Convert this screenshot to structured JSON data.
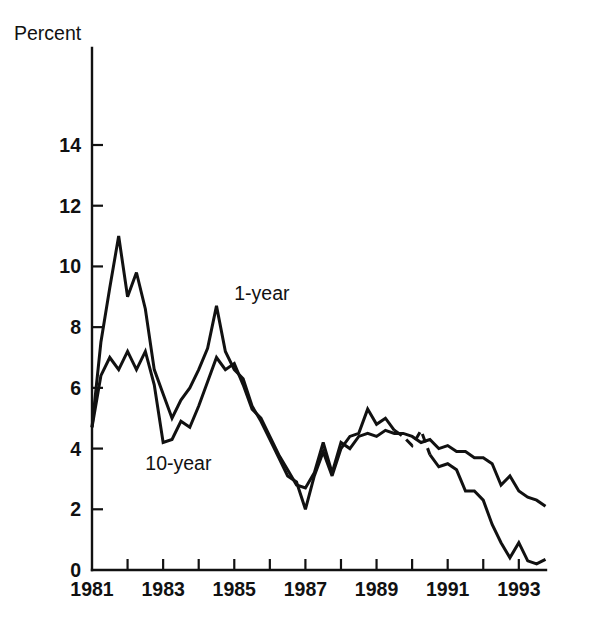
{
  "chart_data": {
    "type": "line",
    "title": "",
    "subtitle": "",
    "xlabel": "",
    "ylabel": "Percent",
    "ylabel_position": "top-left",
    "xlim": [
      1981,
      1993.75
    ],
    "ylim": [
      0,
      15
    ],
    "grid": false,
    "legend": "inline-annotations",
    "y_ticks": [
      0,
      2,
      4,
      6,
      8,
      10,
      12,
      14
    ],
    "y_tick_labels": [
      "0",
      "2",
      "4",
      "6",
      "8",
      "10",
      "12",
      "14"
    ],
    "x_ticks": [
      1981,
      1982,
      1983,
      1984,
      1985,
      1986,
      1987,
      1988,
      1989,
      1990,
      1991,
      1992,
      1993
    ],
    "x_tick_labels": [
      "1981",
      "",
      "1983",
      "",
      "1985",
      "",
      "1987",
      "",
      "1989",
      "",
      "1991",
      "",
      "1993"
    ],
    "x_tick_labels_shown": [
      "1981",
      "1983",
      "1985",
      "1987",
      "1989",
      "1991",
      "1993"
    ],
    "annotations": [
      {
        "text": "1-year",
        "x": 1985.0,
        "y": 8.9,
        "series": "1-year"
      },
      {
        "text": "10-year",
        "x": 1982.5,
        "y": 3.3,
        "series": "10-year"
      }
    ],
    "line_color": "#111111",
    "series": [
      {
        "name": "1-year",
        "style": "solid-with-dashed-gap",
        "dashed_x_range": [
          1989.6,
          1990.4
        ],
        "x": [
          1981.0,
          1981.25,
          1981.5,
          1981.75,
          1982.0,
          1982.25,
          1982.5,
          1982.75,
          1983.0,
          1983.25,
          1983.5,
          1983.75,
          1984.0,
          1984.25,
          1984.5,
          1984.75,
          1985.0,
          1985.25,
          1985.5,
          1985.75,
          1986.0,
          1986.25,
          1986.5,
          1986.75,
          1987.0,
          1987.25,
          1987.5,
          1987.75,
          1988.0,
          1988.25,
          1988.5,
          1988.75,
          1989.0,
          1989.25,
          1989.5,
          1989.75,
          1990.0,
          1990.25,
          1990.5,
          1990.75,
          1991.0,
          1991.25,
          1991.5,
          1991.75,
          1992.0,
          1992.25,
          1992.5,
          1992.75,
          1993.0,
          1993.25,
          1993.5,
          1993.75
        ],
        "y": [
          4.7,
          7.5,
          9.3,
          11.0,
          9.0,
          9.8,
          8.6,
          6.6,
          5.8,
          5.0,
          5.6,
          6.0,
          6.6,
          7.3,
          8.7,
          7.2,
          6.6,
          6.3,
          5.4,
          4.9,
          4.3,
          3.7,
          3.1,
          2.9,
          2.0,
          3.1,
          3.9,
          3.1,
          4.0,
          4.4,
          4.5,
          5.3,
          4.8,
          5.0,
          4.6,
          4.4,
          4.1,
          4.6,
          3.8,
          3.4,
          3.5,
          3.3,
          2.6,
          2.6,
          2.3,
          1.5,
          0.9,
          0.4,
          0.9,
          0.3,
          0.2,
          0.35
        ]
      },
      {
        "name": "10-year",
        "style": "solid",
        "x": [
          1981.0,
          1981.25,
          1981.5,
          1981.75,
          1982.0,
          1982.25,
          1982.5,
          1982.75,
          1983.0,
          1983.25,
          1983.5,
          1983.75,
          1984.0,
          1984.25,
          1984.5,
          1984.75,
          1985.0,
          1985.25,
          1985.5,
          1985.75,
          1986.0,
          1986.25,
          1986.5,
          1986.75,
          1987.0,
          1987.25,
          1987.5,
          1987.75,
          1988.0,
          1988.25,
          1988.5,
          1988.75,
          1989.0,
          1989.25,
          1989.5,
          1989.75,
          1990.0,
          1990.25,
          1990.5,
          1990.75,
          1991.0,
          1991.25,
          1991.5,
          1991.75,
          1992.0,
          1992.25,
          1992.5,
          1992.75,
          1993.0,
          1993.25,
          1993.5,
          1993.75
        ],
        "y": [
          4.7,
          6.4,
          7.0,
          6.6,
          7.2,
          6.6,
          7.2,
          6.1,
          4.2,
          4.3,
          4.9,
          4.7,
          5.4,
          6.2,
          7.0,
          6.6,
          6.8,
          6.1,
          5.3,
          5.0,
          4.4,
          3.8,
          3.3,
          2.8,
          2.7,
          3.2,
          4.2,
          3.2,
          4.2,
          4.0,
          4.4,
          4.5,
          4.4,
          4.6,
          4.5,
          4.5,
          4.4,
          4.2,
          4.3,
          4.0,
          4.1,
          3.9,
          3.9,
          3.7,
          3.7,
          3.5,
          2.8,
          3.1,
          2.6,
          2.4,
          2.3,
          2.1
        ]
      }
    ]
  },
  "figure": {
    "background": "#ffffff",
    "axis_color": "#111111"
  }
}
